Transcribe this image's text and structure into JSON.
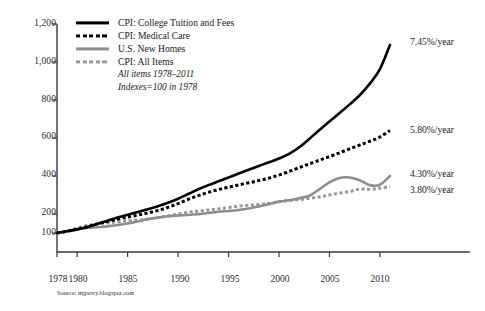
{
  "chart_data": {
    "type": "line",
    "title": "",
    "subtitle_lines": [
      "All items 1978–2011",
      "Indexes=100 in 1978"
    ],
    "xlabel": "",
    "ylabel": "",
    "grid": false,
    "legend_position": "top-left",
    "xlim": [
      1978,
      2011
    ],
    "ylim": [
      0,
      1200
    ],
    "yticks": [
      100,
      200,
      400,
      600,
      800,
      1000,
      1200
    ],
    "ytick_labels": [
      "100",
      "200",
      "400",
      "600",
      "800",
      "1,000",
      "1,200"
    ],
    "xticks": [
      1978,
      1980,
      1985,
      1990,
      1995,
      2000,
      2005,
      2010
    ],
    "xtick_labels": [
      "1978",
      "1980",
      "1985",
      "1990",
      "1995",
      "2000",
      "2005",
      "2010"
    ],
    "x": [
      1978,
      1979,
      1980,
      1981,
      1982,
      1983,
      1984,
      1985,
      1986,
      1987,
      1988,
      1989,
      1990,
      1991,
      1992,
      1993,
      1994,
      1995,
      1996,
      1997,
      1998,
      1999,
      2000,
      2001,
      2002,
      2003,
      2004,
      2005,
      2006,
      2007,
      2008,
      2009,
      2010,
      2011
    ],
    "series": [
      {
        "name": "CPI: College Tuition and Fees",
        "color": "#000000",
        "style": "solid",
        "rate_label": "7.45%/year",
        "values": [
          100,
          109,
          119,
          132,
          148,
          165,
          181,
          196,
          211,
          225,
          241,
          259,
          280,
          305,
          330,
          352,
          372,
          392,
          413,
          433,
          453,
          472,
          492,
          516,
          551,
          595,
          642,
          687,
          731,
          777,
          825,
          886,
          962,
          1090
        ]
      },
      {
        "name": "CPI: Medical Care",
        "color": "#000000",
        "style": "dashed",
        "rate_label": "5.80%/year",
        "values": [
          100,
          109,
          120,
          133,
          148,
          161,
          173,
          184,
          194,
          205,
          219,
          235,
          255,
          277,
          297,
          314,
          329,
          341,
          353,
          364,
          376,
          389,
          405,
          424,
          444,
          464,
          483,
          502,
          522,
          543,
          563,
          583,
          605,
          640
        ]
      },
      {
        "name": "U.S. New Homes",
        "color": "#8e8e8e",
        "style": "solid",
        "rate_label": "4.30%/year",
        "values": [
          100,
          111,
          120,
          127,
          130,
          135,
          142,
          150,
          161,
          172,
          181,
          188,
          192,
          195,
          199,
          205,
          212,
          216,
          221,
          229,
          240,
          252,
          265,
          272,
          283,
          296,
          330,
          367,
          390,
          392,
          378,
          352,
          354,
          400
        ]
      },
      {
        "name": "CPI: All Items",
        "color": "#9a9a9a",
        "style": "dashed",
        "rate_label": "3.80%/year",
        "values": [
          100,
          111,
          126,
          139,
          148,
          153,
          159,
          165,
          168,
          174,
          181,
          190,
          200,
          209,
          215,
          221,
          227,
          234,
          241,
          246,
          250,
          256,
          264,
          272,
          276,
          282,
          290,
          300,
          310,
          318,
          331,
          330,
          335,
          345
        ]
      }
    ]
  },
  "legend": {
    "items": [
      {
        "label": "CPI: College Tuition and Fees",
        "swatch": "sw-solid-black"
      },
      {
        "label": "CPI: Medical Care",
        "swatch": "sw-dash-black"
      },
      {
        "label": "U.S. New Homes",
        "swatch": "sw-solid-gray"
      },
      {
        "label": "CPI: All Items",
        "swatch": "sw-dash-gray"
      }
    ],
    "note_line_1": "All items 1978–2011",
    "note_line_2": "Indexes=100 in 1978"
  },
  "annotations": {
    "tuition_rate": "7.45%/year",
    "medical_rate": "5.80%/year",
    "homes_rate": "4.30%/year",
    "allitems_rate": "3.80%/year"
  },
  "source": {
    "text": "Source: mjperry.blogspot.com"
  },
  "axis": {
    "y_labels": [
      "1,200",
      "1,000",
      "800",
      "600",
      "400",
      "200",
      "100"
    ],
    "x_labels": [
      "1978",
      "1980",
      "1985",
      "1990",
      "1995",
      "2000",
      "2005",
      "2010"
    ]
  }
}
